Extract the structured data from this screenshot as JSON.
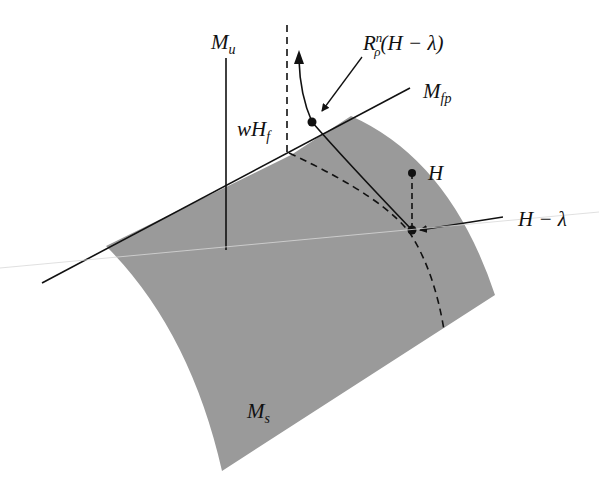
{
  "diagram": {
    "colors": {
      "manifold_fill": "#9a9a9a",
      "line": "#111111",
      "background": "#ffffff"
    },
    "labels": {
      "unstable_manifold": {
        "main": "M",
        "sub": "u"
      },
      "fixed_point_manifold": {
        "main": "M",
        "sub": "fp"
      },
      "stable_manifold": {
        "main": "M",
        "sub": "s"
      },
      "weak_set": {
        "prefix": "wH",
        "sub": "f"
      },
      "renormalization": {
        "main": "R",
        "sup": "n",
        "sub": "ρ",
        "arg": "(H − λ)"
      },
      "point_H": "H",
      "point_H_minus_lambda": "H − λ"
    }
  }
}
